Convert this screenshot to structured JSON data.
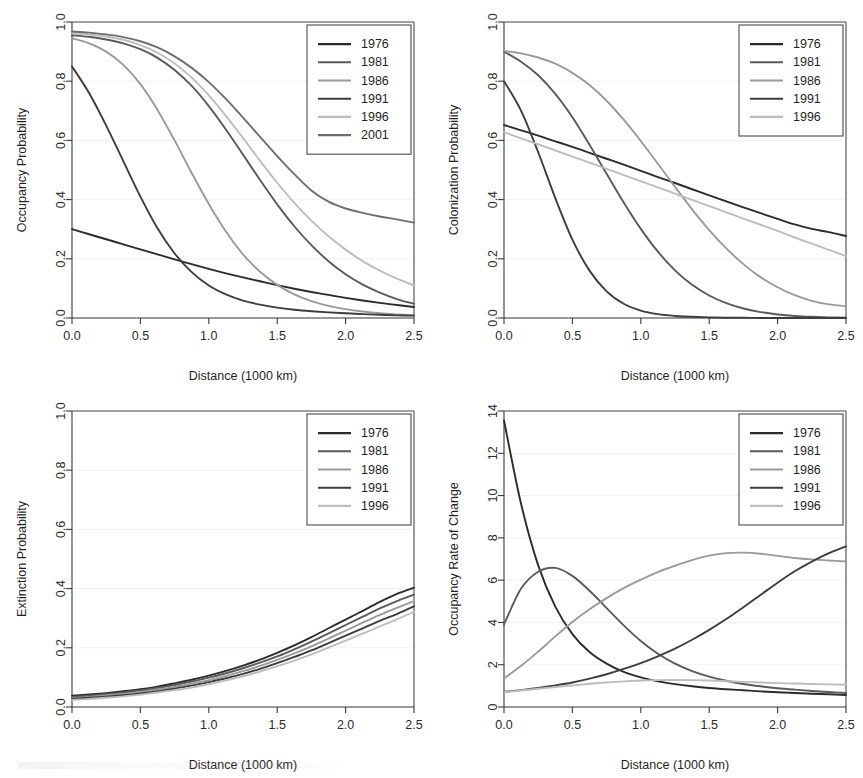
{
  "figure": {
    "width": 863,
    "height": 778,
    "background": "#ffffff",
    "panel_count": 4,
    "shared_xlabel": "Distance (1000 km)"
  },
  "series_colors": {
    "1976": "#2b2b2b",
    "1981": "#5a5a5a",
    "1986": "#9a9a9a",
    "1991": "#3d3d3d",
    "1996": "#bdbdbd",
    "2001": "#6e6e6e"
  },
  "chart_data": [
    {
      "type": "line",
      "panel": "top-left",
      "title": "",
      "xlabel": "Distance (1000 km)",
      "ylabel": "Occupancy Probability",
      "xlim": [
        0.0,
        2.5
      ],
      "ylim": [
        0.0,
        1.0
      ],
      "xticks": [
        "0.0",
        "0.5",
        "1.0",
        "1.5",
        "2.0",
        "2.5"
      ],
      "yticks": [
        "0.0",
        "0.2",
        "0.4",
        "0.6",
        "0.8",
        "1.0"
      ],
      "grid": true,
      "legend_position": "top-right",
      "x": [
        0.0,
        0.125,
        0.25,
        0.375,
        0.5,
        0.625,
        0.75,
        0.875,
        1.0,
        1.125,
        1.25,
        1.375,
        1.5,
        1.625,
        1.75,
        1.875,
        2.0,
        2.125,
        2.25,
        2.375,
        2.5
      ],
      "series": [
        {
          "name": "1976",
          "values": [
            0.3,
            0.283,
            0.266,
            0.249,
            0.232,
            0.215,
            0.198,
            0.182,
            0.166,
            0.151,
            0.137,
            0.124,
            0.111,
            0.099,
            0.088,
            0.078,
            0.068,
            0.059,
            0.051,
            0.044,
            0.037
          ]
        },
        {
          "name": "1981",
          "values": [
            0.955,
            0.95,
            0.941,
            0.928,
            0.908,
            0.879,
            0.838,
            0.784,
            0.716,
            0.637,
            0.552,
            0.466,
            0.384,
            0.31,
            0.246,
            0.192,
            0.148,
            0.113,
            0.086,
            0.064,
            0.048
          ]
        },
        {
          "name": "1986",
          "values": [
            0.945,
            0.928,
            0.9,
            0.855,
            0.79,
            0.703,
            0.6,
            0.49,
            0.385,
            0.292,
            0.215,
            0.156,
            0.112,
            0.08,
            0.057,
            0.041,
            0.03,
            0.022,
            0.016,
            0.012,
            0.009
          ]
        },
        {
          "name": "1991",
          "values": [
            0.85,
            0.76,
            0.65,
            0.53,
            0.41,
            0.303,
            0.218,
            0.155,
            0.11,
            0.08,
            0.059,
            0.045,
            0.035,
            0.028,
            0.023,
            0.019,
            0.016,
            0.013,
            0.011,
            0.009,
            0.008
          ]
        },
        {
          "name": "1996",
          "values": [
            0.962,
            0.958,
            0.951,
            0.94,
            0.922,
            0.896,
            0.86,
            0.812,
            0.752,
            0.683,
            0.608,
            0.531,
            0.457,
            0.389,
            0.329,
            0.276,
            0.231,
            0.192,
            0.16,
            0.133,
            0.11
          ]
        },
        {
          "name": "2001",
          "values": [
            0.968,
            0.964,
            0.958,
            0.949,
            0.935,
            0.914,
            0.884,
            0.845,
            0.797,
            0.74,
            0.677,
            0.612,
            0.547,
            0.486,
            0.431,
            0.393,
            0.37,
            0.355,
            0.343,
            0.333,
            0.322
          ]
        }
      ],
      "legend": [
        "1976",
        "1981",
        "1986",
        "1991",
        "1996",
        "2001"
      ]
    },
    {
      "type": "line",
      "panel": "top-right",
      "title": "",
      "xlabel": "Distance (1000 km)",
      "ylabel": "Colonization Probability",
      "xlim": [
        0.0,
        2.5
      ],
      "ylim": [
        0.0,
        1.0
      ],
      "xticks": [
        "0.0",
        "0.5",
        "1.0",
        "1.5",
        "2.0",
        "2.5"
      ],
      "yticks": [
        "0.0",
        "0.2",
        "0.4",
        "0.6",
        "0.8",
        "1.0"
      ],
      "grid": true,
      "legend_position": "top-right",
      "x": [
        0.0,
        0.125,
        0.25,
        0.375,
        0.5,
        0.625,
        0.75,
        0.875,
        1.0,
        1.125,
        1.25,
        1.375,
        1.5,
        1.625,
        1.75,
        1.875,
        2.0,
        2.125,
        2.25,
        2.375,
        2.5
      ],
      "series": [
        {
          "name": "1976",
          "values": [
            0.652,
            0.634,
            0.616,
            0.597,
            0.578,
            0.558,
            0.538,
            0.518,
            0.497,
            0.476,
            0.456,
            0.435,
            0.414,
            0.394,
            0.374,
            0.354,
            0.335,
            0.316,
            0.301,
            0.29,
            0.277
          ]
        },
        {
          "name": "1981",
          "values": [
            0.9,
            0.866,
            0.82,
            0.757,
            0.678,
            0.585,
            0.487,
            0.39,
            0.301,
            0.224,
            0.161,
            0.112,
            0.076,
            0.05,
            0.032,
            0.02,
            0.012,
            0.007,
            0.004,
            0.002,
            0.001
          ]
        },
        {
          "name": "1986",
          "values": [
            0.902,
            0.894,
            0.88,
            0.859,
            0.828,
            0.787,
            0.734,
            0.67,
            0.598,
            0.521,
            0.443,
            0.367,
            0.297,
            0.235,
            0.182,
            0.138,
            0.104,
            0.077,
            0.058,
            0.046,
            0.04
          ]
        },
        {
          "name": "1991",
          "values": [
            0.8,
            0.7,
            0.56,
            0.405,
            0.265,
            0.16,
            0.09,
            0.048,
            0.025,
            0.013,
            0.007,
            0.004,
            0.002,
            0.001,
            0.001,
            0.0,
            0.0,
            0.0,
            0.0,
            0.0,
            0.0
          ]
        },
        {
          "name": "1996",
          "values": [
            0.628,
            0.607,
            0.587,
            0.566,
            0.545,
            0.525,
            0.504,
            0.483,
            0.462,
            0.441,
            0.42,
            0.399,
            0.378,
            0.357,
            0.336,
            0.315,
            0.294,
            0.272,
            0.251,
            0.23,
            0.209
          ]
        }
      ],
      "legend": [
        "1976",
        "1981",
        "1986",
        "1991",
        "1996"
      ]
    },
    {
      "type": "line",
      "panel": "bottom-left",
      "title": "",
      "xlabel": "Distance (1000 km)",
      "ylabel": "Extinction Probability",
      "xlim": [
        0.0,
        2.5
      ],
      "ylim": [
        0.0,
        1.0
      ],
      "xticks": [
        "0.0",
        "0.5",
        "1.0",
        "1.5",
        "2.0",
        "2.5"
      ],
      "yticks": [
        "0.0",
        "0.2",
        "0.4",
        "0.6",
        "0.8",
        "1.0"
      ],
      "grid": true,
      "legend_position": "top-right",
      "x": [
        0.0,
        0.125,
        0.25,
        0.375,
        0.5,
        0.625,
        0.75,
        0.875,
        1.0,
        1.125,
        1.25,
        1.375,
        1.5,
        1.625,
        1.75,
        1.875,
        2.0,
        2.125,
        2.25,
        2.375,
        2.5
      ],
      "series": [
        {
          "name": "1976",
          "values": [
            0.038,
            0.042,
            0.047,
            0.053,
            0.06,
            0.069,
            0.08,
            0.092,
            0.106,
            0.122,
            0.14,
            0.16,
            0.183,
            0.208,
            0.236,
            0.266,
            0.295,
            0.325,
            0.355,
            0.382,
            0.403
          ]
        },
        {
          "name": "1981",
          "values": [
            0.034,
            0.038,
            0.043,
            0.049,
            0.056,
            0.064,
            0.074,
            0.086,
            0.099,
            0.114,
            0.131,
            0.15,
            0.171,
            0.195,
            0.221,
            0.249,
            0.277,
            0.305,
            0.333,
            0.358,
            0.38
          ]
        },
        {
          "name": "1986",
          "values": [
            0.03,
            0.034,
            0.039,
            0.044,
            0.051,
            0.059,
            0.068,
            0.079,
            0.091,
            0.105,
            0.121,
            0.139,
            0.159,
            0.181,
            0.205,
            0.231,
            0.258,
            0.285,
            0.311,
            0.335,
            0.358
          ]
        },
        {
          "name": "1991",
          "values": [
            0.027,
            0.031,
            0.035,
            0.04,
            0.046,
            0.053,
            0.062,
            0.072,
            0.084,
            0.097,
            0.112,
            0.129,
            0.148,
            0.169,
            0.191,
            0.216,
            0.241,
            0.266,
            0.291,
            0.314,
            0.34
          ]
        },
        {
          "name": "1996",
          "values": [
            0.024,
            0.027,
            0.031,
            0.036,
            0.042,
            0.049,
            0.057,
            0.066,
            0.077,
            0.09,
            0.104,
            0.12,
            0.138,
            0.157,
            0.178,
            0.201,
            0.224,
            0.248,
            0.272,
            0.296,
            0.322
          ]
        }
      ],
      "legend": [
        "1976",
        "1981",
        "1986",
        "1991",
        "1996"
      ]
    },
    {
      "type": "line",
      "panel": "bottom-right",
      "title": "",
      "xlabel": "Distance (1000 km)",
      "ylabel": "Occupancy Rate of Change",
      "xlim": [
        0.0,
        2.5
      ],
      "ylim": [
        0,
        14
      ],
      "xticks": [
        "0.0",
        "0.5",
        "1.0",
        "1.5",
        "2.0",
        "2.5"
      ],
      "yticks": [
        "0",
        "2",
        "4",
        "6",
        "8",
        "10",
        "12",
        "14"
      ],
      "grid": true,
      "legend_position": "top-right",
      "x": [
        0.0,
        0.125,
        0.25,
        0.375,
        0.5,
        0.625,
        0.75,
        0.875,
        1.0,
        1.125,
        1.25,
        1.375,
        1.5,
        1.625,
        1.75,
        1.875,
        2.0,
        2.125,
        2.25,
        2.375,
        2.5
      ],
      "series": [
        {
          "name": "1976",
          "values": [
            13.55,
            9.6,
            6.7,
            4.75,
            3.45,
            2.6,
            2.05,
            1.66,
            1.4,
            1.21,
            1.08,
            0.98,
            0.9,
            0.84,
            0.79,
            0.74,
            0.7,
            0.66,
            0.63,
            0.6,
            0.57
          ]
        },
        {
          "name": "1981",
          "values": [
            3.9,
            5.6,
            6.4,
            6.58,
            6.2,
            5.5,
            4.68,
            3.86,
            3.12,
            2.52,
            2.05,
            1.7,
            1.44,
            1.24,
            1.09,
            0.98,
            0.89,
            0.82,
            0.76,
            0.71,
            0.66
          ]
        },
        {
          "name": "1986",
          "values": [
            1.35,
            1.95,
            2.62,
            3.34,
            4.02,
            4.62,
            5.15,
            5.62,
            6.02,
            6.38,
            6.68,
            6.95,
            7.16,
            7.28,
            7.3,
            7.25,
            7.15,
            7.05,
            6.98,
            6.93,
            6.88
          ]
        },
        {
          "name": "1991",
          "values": [
            0.72,
            0.8,
            0.9,
            1.02,
            1.16,
            1.34,
            1.55,
            1.8,
            2.08,
            2.4,
            2.76,
            3.18,
            3.65,
            4.16,
            4.72,
            5.3,
            5.88,
            6.42,
            6.88,
            7.28,
            7.6
          ]
        },
        {
          "name": "1996",
          "values": [
            0.7,
            0.78,
            0.86,
            0.94,
            1.02,
            1.1,
            1.16,
            1.21,
            1.25,
            1.27,
            1.28,
            1.27,
            1.25,
            1.22,
            1.19,
            1.16,
            1.13,
            1.11,
            1.09,
            1.07,
            1.05
          ]
        }
      ],
      "legend": [
        "1976",
        "1981",
        "1986",
        "1991",
        "1996"
      ]
    }
  ]
}
